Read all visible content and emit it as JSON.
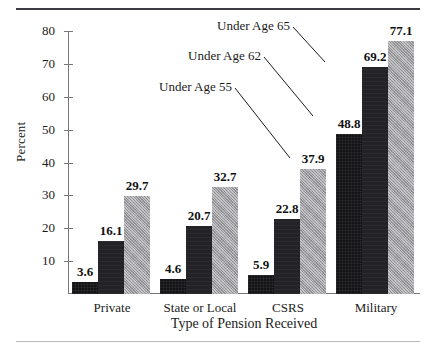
{
  "chart_data": {
    "type": "bar",
    "title": "",
    "xlabel": "Type of Pension Received",
    "ylabel": "Percent",
    "ylim": [
      0,
      80
    ],
    "yticks": [
      0,
      10,
      20,
      30,
      40,
      50,
      60,
      70,
      80
    ],
    "ytick_labels": [
      "",
      "10",
      "20",
      "30",
      "40",
      "50",
      "60",
      "70",
      "80"
    ],
    "grid": false,
    "legend_position": "annotations-on-bars",
    "categories": [
      "Private",
      "State or Local",
      "CSRS",
      "Military"
    ],
    "series": [
      {
        "name": "Under Age 55",
        "color": "#141416",
        "values": [
          3.6,
          4.6,
          5.9,
          48.8
        ]
      },
      {
        "name": "Under Age 62",
        "color": "#232327",
        "values": [
          16.1,
          20.7,
          22.8,
          69.2
        ]
      },
      {
        "name": "Under Age 65",
        "color": "#9d9da2",
        "values": [
          29.7,
          32.7,
          37.9,
          77.1
        ]
      }
    ],
    "annotations": [
      {
        "text": "Under Age 65",
        "points_to": "Military / Under Age 65 bar"
      },
      {
        "text": "Under Age 62",
        "points_to": "Military / Under Age 62 bar"
      },
      {
        "text": "Under Age 55",
        "points_to": "Military / Under Age 55 bar"
      }
    ]
  },
  "axes": {
    "y_label": "Percent",
    "x_label": "Type of Pension Received",
    "y_ticks": [
      {
        "label": "80",
        "value": 80
      },
      {
        "label": "70",
        "value": 70
      },
      {
        "label": "60",
        "value": 60
      },
      {
        "label": "50",
        "value": 50
      },
      {
        "label": "40",
        "value": 40
      },
      {
        "label": "30",
        "value": 30
      },
      {
        "label": "20",
        "value": 20
      },
      {
        "label": "10",
        "value": 10
      }
    ]
  },
  "groups": [
    {
      "label": "Private",
      "bars": [
        {
          "series": "Under Age 55",
          "value": 3.6,
          "value_label": "3.6"
        },
        {
          "series": "Under Age 62",
          "value": 16.1,
          "value_label": "16.1"
        },
        {
          "series": "Under Age 65",
          "value": 29.7,
          "value_label": "29.7"
        }
      ]
    },
    {
      "label": "State or Local",
      "bars": [
        {
          "series": "Under Age 55",
          "value": 4.6,
          "value_label": "4.6"
        },
        {
          "series": "Under Age 62",
          "value": 20.7,
          "value_label": "20.7"
        },
        {
          "series": "Under Age 65",
          "value": 32.7,
          "value_label": "32.7"
        }
      ]
    },
    {
      "label": "CSRS",
      "bars": [
        {
          "series": "Under Age 55",
          "value": 5.9,
          "value_label": "5.9"
        },
        {
          "series": "Under Age 62",
          "value": 22.8,
          "value_label": "22.8"
        },
        {
          "series": "Under Age 65",
          "value": 37.9,
          "value_label": "37.9"
        }
      ]
    },
    {
      "label": "Military",
      "bars": [
        {
          "series": "Under Age 55",
          "value": 48.8,
          "value_label": "48.8"
        },
        {
          "series": "Under Age 62",
          "value": 69.2,
          "value_label": "69.2"
        },
        {
          "series": "Under Age 65",
          "value": 77.1,
          "value_label": "77.1"
        }
      ]
    }
  ],
  "annotations": [
    {
      "label": "Under Age 65"
    },
    {
      "label": "Under Age 62"
    },
    {
      "label": "Under Age 55"
    }
  ]
}
